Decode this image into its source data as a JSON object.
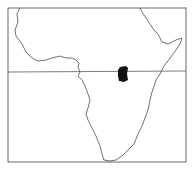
{
  "map": {
    "subject": "Africa outline map",
    "frame": true,
    "equator_line": true,
    "highlighted_region": {
      "description": "small filled region near the equator in central-east Africa",
      "color": "#111111"
    },
    "line_color": "#333333",
    "background": "#ffffff"
  }
}
